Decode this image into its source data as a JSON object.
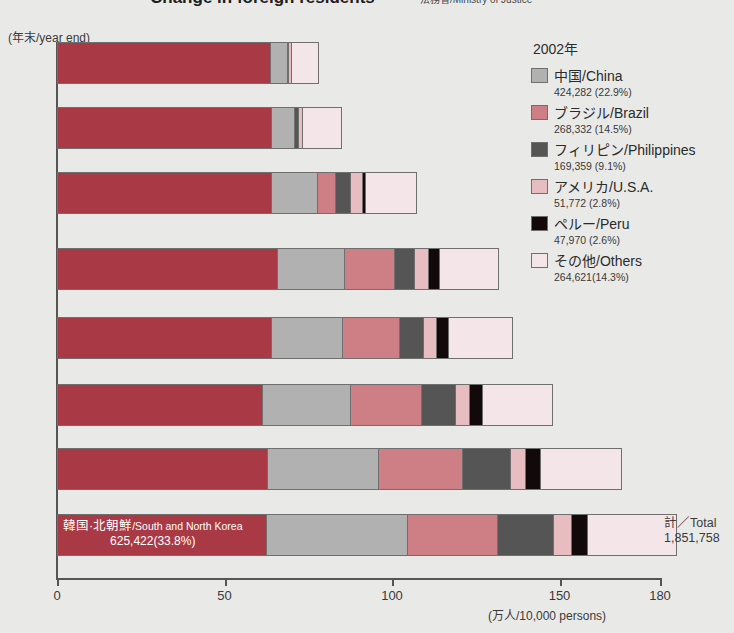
{
  "header": {
    "title": "Change in foreign residents",
    "source": "法務省/Ministry of Justice"
  },
  "axes": {
    "y_caption": "(年末/year end)",
    "x_unit": "(万人/10,000 persons)",
    "x_ticks": [
      "0",
      "50",
      "100",
      "150",
      "180"
    ],
    "y_labels": [
      "1980",
      "85",
      "90",
      "93",
      "95",
      "98",
      "2000",
      "2002"
    ]
  },
  "annotation": {
    "korea_jp": "韓国·北朝鮮",
    "korea_en": "/South and North Korea",
    "korea_value": "625,422(33.8%)"
  },
  "total": {
    "label": "計／Total",
    "value": "1,851,758"
  },
  "legend": {
    "title": "2002年",
    "items": [
      {
        "name": "中国/China",
        "value": "424,282 (22.9%)",
        "color": "#b1b1b1",
        "key": "china"
      },
      {
        "name": "ブラジル/Brazil",
        "value": "268,332 (14.5%)",
        "color": "#cd7f85",
        "key": "brazil"
      },
      {
        "name": "フィリピン/Philippines",
        "value": "169,359 (9.1%)",
        "color": "#555555",
        "key": "philippines"
      },
      {
        "name": "アメリカ/U.S.A.",
        "value": "51,772 (2.8%)",
        "color": "#e7bdc2",
        "key": "usa"
      },
      {
        "name": "ペルー/Peru",
        "value": "47,970 (2.6%)",
        "color": "#120a0a",
        "key": "peru"
      },
      {
        "name": "その他/Others",
        "value": "264,621(14.3%)",
        "color": "#f4e6e8",
        "key": "others"
      }
    ]
  },
  "chart_data": {
    "type": "bar",
    "orientation": "horizontal",
    "stacked": true,
    "title": "Change in foreign residents",
    "xlabel": "(万人/10,000 persons)",
    "ylabel": "(年末/year end)",
    "xlim": [
      0,
      180
    ],
    "xticks": [
      0,
      50,
      100,
      150,
      180
    ],
    "grid": false,
    "legend_position": "right",
    "categories": [
      "1980",
      "85",
      "90",
      "93",
      "95",
      "98",
      "2000",
      "2002"
    ],
    "series": [
      {
        "name": "韓国·北朝鮮/South and North Korea",
        "color": "#a93945",
        "values": [
          67.7,
          68.4,
          68.8,
          68.2,
          66.7,
          63.8,
          63.5,
          62.5
        ]
      },
      {
        "name": "中国/China",
        "color": "#b1b1b1",
        "values": [
          5.2,
          7.4,
          15.0,
          21.0,
          22.2,
          27.2,
          33.5,
          42.4
        ]
      },
      {
        "name": "ブラジル/Brazil",
        "color": "#cd7f85",
        "values": [
          0.0,
          0.0,
          5.6,
          15.4,
          17.6,
          22.2,
          25.4,
          26.8
        ]
      },
      {
        "name": "フィリピン/Philippines",
        "color": "#555555",
        "values": [
          0.5,
          1.2,
          4.9,
          6.2,
          7.4,
          10.5,
          14.4,
          16.9
        ]
      },
      {
        "name": "アメリカ/U.S.A.",
        "color": "#e7bdc2",
        "values": [
          1.0,
          1.5,
          3.8,
          4.3,
          4.3,
          4.3,
          4.5,
          5.2
        ]
      },
      {
        "name": "ペルー/Peru",
        "color": "#120a0a",
        "values": [
          0.0,
          0.0,
          1.0,
          3.6,
          3.6,
          4.1,
          4.6,
          4.8
        ]
      },
      {
        "name": "その他/Others",
        "color": "#f4e6e8",
        "values": [
          8.2,
          12.0,
          16.2,
          18.0,
          19.7,
          21.7,
          24.1,
          26.5
        ]
      }
    ],
    "totals": [
      78.3,
      85.0,
      107.5,
      132.0,
      136.2,
      148.2,
      168.6,
      185.2
    ]
  }
}
